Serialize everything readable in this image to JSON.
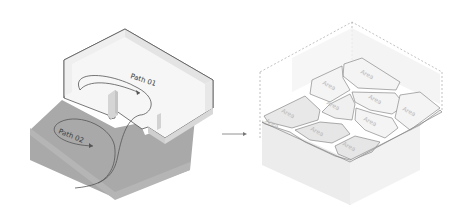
{
  "left_diagram": {
    "path_labels": [
      {
        "text": "Path 01"
      },
      {
        "text": "Path 02"
      }
    ],
    "colors": {
      "ground": "#a9a9a9",
      "ground_side": "#9c9c9c",
      "wall_top": "#f2f2f2",
      "floor": "#f7f7f7",
      "outline": "#555555"
    }
  },
  "arrow": {
    "direction": "right",
    "color": "#777777"
  },
  "right_diagram": {
    "area_labels": [
      "Area",
      "Area",
      "Area",
      "Area",
      "Area",
      "Area",
      "Area",
      "Area",
      "Area",
      "Area"
    ],
    "colors": {
      "cell": "#f4f4f4",
      "cell_shade": "#e6e6e6",
      "cell_stroke": "#777777",
      "dashed": "#999999",
      "area_text": "#b8b8b8"
    }
  }
}
